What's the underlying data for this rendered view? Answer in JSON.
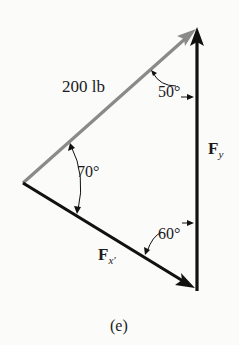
{
  "figure": {
    "caption": "(e)",
    "forces": {
      "resultant": {
        "label": "200 lb",
        "color": "#8a8a8a"
      },
      "fx": {
        "symbol": "F",
        "subscript": "x′",
        "color": "#111111"
      },
      "fy": {
        "symbol": "F",
        "subscript": "y",
        "color": "#111111"
      }
    },
    "angles": {
      "top": "50°",
      "left": "70°",
      "bottom": "60°"
    }
  }
}
